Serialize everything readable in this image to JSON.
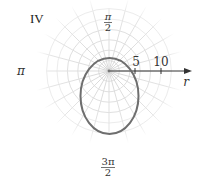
{
  "quadrant_label": "IV",
  "chart_data": {
    "type": "line",
    "subtype": "polar",
    "title": "",
    "curve": "ellipse (conic) in polar coordinates, pole inside upper part of ellipse",
    "axis_labels": {
      "angle_0": "",
      "angle_pi_over_2": "π/2",
      "angle_pi": "π",
      "angle_3pi_over_2": "3π/2",
      "radial": "r"
    },
    "angle_labels": [
      {
        "numerator": "π",
        "denominator": "2",
        "position": "top"
      },
      {
        "text": "π",
        "position": "left"
      },
      {
        "numerator": "3π",
        "denominator": "2",
        "position": "bottom"
      }
    ],
    "radial_ticks": [
      5,
      10
    ],
    "radial_tick_labels": [
      "5",
      "10"
    ],
    "grid": {
      "circles_every": 2,
      "max_radius": 12,
      "radial_lines_every_deg": 15
    },
    "approx_points_polar": [
      {
        "theta": "0",
        "r": 5.5
      },
      {
        "theta": "π/2",
        "r": 2.5
      },
      {
        "theta": "π",
        "r": 5.5
      },
      {
        "theta": "3π/2",
        "r": 12
      }
    ],
    "colors": {
      "curve": "#6e6e6e",
      "grid": "#e2e2e2",
      "axis": "#333333"
    }
  }
}
